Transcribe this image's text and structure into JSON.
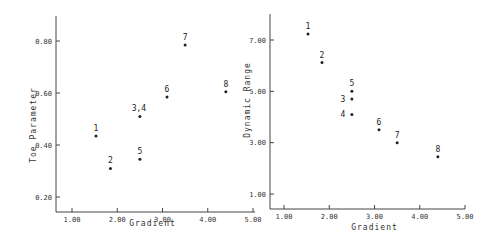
{
  "chart_data": [
    {
      "type": "scatter",
      "title": "",
      "xlabel": "Gradient",
      "ylabel": "Toe Parameter",
      "xlim": [
        0.7,
        5.0
      ],
      "ylim": [
        0.14,
        0.9
      ],
      "xticks": [
        1.0,
        2.0,
        3.0,
        4.0,
        5.0
      ],
      "xtick_labels": [
        "1.00",
        "2.00",
        "3.00",
        "4.00",
        "5.00"
      ],
      "yticks": [
        0.2,
        0.4,
        0.6,
        0.8
      ],
      "ytick_labels": [
        "0.20",
        "0.40",
        "0.60",
        "0.80"
      ],
      "grid": false,
      "points": [
        {
          "label": "1",
          "x": 1.53,
          "y": 0.435
        },
        {
          "label": "2",
          "x": 1.85,
          "y": 0.31
        },
        {
          "label": "3,4",
          "x": 2.5,
          "y": 0.51
        },
        {
          "label": "5",
          "x": 2.5,
          "y": 0.345
        },
        {
          "label": "6",
          "x": 3.1,
          "y": 0.585
        },
        {
          "label": "7",
          "x": 3.5,
          "y": 0.785
        },
        {
          "label": "8",
          "x": 4.4,
          "y": 0.605
        }
      ]
    },
    {
      "type": "scatter",
      "title": "",
      "xlabel": "Gradient",
      "ylabel": "Dynamic Range",
      "xlim": [
        0.7,
        5.0
      ],
      "ylim": [
        0.4,
        8.4
      ],
      "xticks": [
        1.0,
        2.0,
        3.0,
        4.0,
        5.0
      ],
      "xtick_labels": [
        "1.00",
        "2.00",
        "3.00",
        "4.00",
        "5.00"
      ],
      "yticks": [
        1.0,
        3.0,
        5.0,
        7.0
      ],
      "ytick_labels": [
        "1.00",
        "3.00",
        "5.00",
        "7.00"
      ],
      "grid": false,
      "points": [
        {
          "label": "1",
          "x": 1.53,
          "y": 7.23
        },
        {
          "label": "2",
          "x": 1.84,
          "y": 6.12
        },
        {
          "label": "3",
          "x": 2.5,
          "y": 4.7
        },
        {
          "label": "4",
          "x": 2.5,
          "y": 4.1
        },
        {
          "label": "5",
          "x": 2.5,
          "y": 5.0
        },
        {
          "label": "6",
          "x": 3.1,
          "y": 3.5
        },
        {
          "label": "7",
          "x": 3.5,
          "y": 3.0
        },
        {
          "label": "8",
          "x": 4.4,
          "y": 2.45
        }
      ]
    }
  ]
}
